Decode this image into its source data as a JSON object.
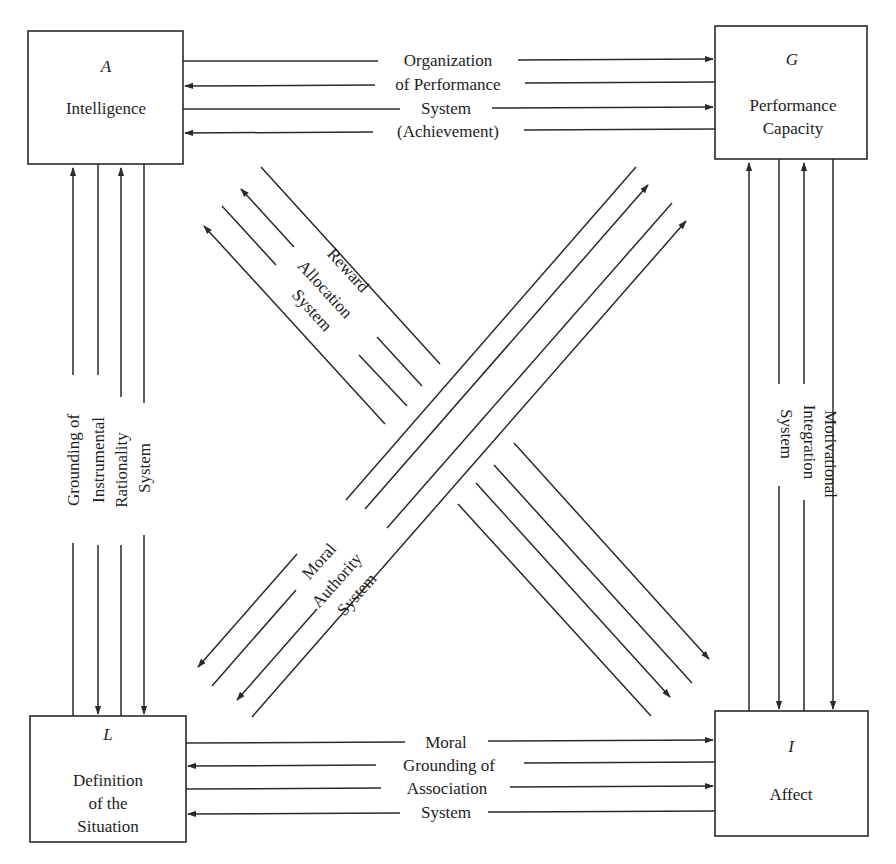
{
  "diagram": {
    "type": "AGIL interchange diagram",
    "boxes": {
      "A": {
        "letter": "A",
        "lines": [
          "Intelligence"
        ]
      },
      "G": {
        "letter": "G",
        "lines": [
          "Performance",
          "Capacity"
        ]
      },
      "L": {
        "letter": "L",
        "lines": [
          "Definition",
          "of the",
          "Situation"
        ]
      },
      "I": {
        "letter": "I",
        "lines": [
          "Affect"
        ]
      }
    },
    "interchanges": {
      "top": {
        "between": "A-G",
        "lines": [
          "Organization",
          "of Performance",
          "System",
          "(Achievement)"
        ]
      },
      "bottom": {
        "between": "L-I",
        "lines": [
          "Moral",
          "Grounding of",
          "Association",
          "System"
        ]
      },
      "left": {
        "between": "A-L",
        "lines": [
          "Grounding of",
          "Instrumental",
          "Rationality",
          "System"
        ]
      },
      "right": {
        "between": "G-I",
        "lines": [
          "Motivational",
          "Integration",
          "System"
        ]
      },
      "diag_nw_se": {
        "between": "A-I",
        "lines": [
          "Reward",
          "Allocation",
          "System"
        ]
      },
      "diag_sw_ne": {
        "between": "L-G",
        "lines": [
          "Moral",
          "Authority",
          "System"
        ]
      }
    },
    "colors": {
      "line": "#2a2a2a",
      "text": "#1e1e1e",
      "background": "#ffffff"
    }
  }
}
